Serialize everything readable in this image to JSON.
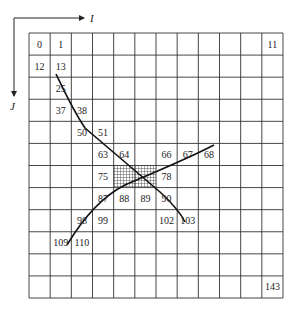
{
  "diagram": {
    "type": "grid-index-diagram",
    "axes": {
      "horizontal_label": "I",
      "vertical_label": "J"
    },
    "grid": {
      "columns": 12,
      "rows": 12,
      "x0": 29,
      "y0": 33,
      "x1": 283,
      "y1": 298
    },
    "cell_labels": [
      {
        "text": "0",
        "row": 0,
        "col": 0
      },
      {
        "text": "1",
        "row": 0,
        "col": 1
      },
      {
        "text": "11",
        "row": 0,
        "col": 11
      },
      {
        "text": "12",
        "row": 1,
        "col": 0
      },
      {
        "text": "13",
        "row": 1,
        "col": 1
      },
      {
        "text": "25",
        "row": 2,
        "col": 1
      },
      {
        "text": "37",
        "row": 3,
        "col": 1
      },
      {
        "text": "38",
        "row": 3,
        "col": 2
      },
      {
        "text": "50",
        "row": 4,
        "col": 2
      },
      {
        "text": "51",
        "row": 4,
        "col": 3
      },
      {
        "text": "63",
        "row": 5,
        "col": 3
      },
      {
        "text": "64",
        "row": 5,
        "col": 4
      },
      {
        "text": "66",
        "row": 5,
        "col": 6
      },
      {
        "text": "67",
        "row": 5,
        "col": 7
      },
      {
        "text": "68",
        "row": 5,
        "col": 8
      },
      {
        "text": "75",
        "row": 6,
        "col": 3
      },
      {
        "text": "78",
        "row": 6,
        "col": 6
      },
      {
        "text": "87",
        "row": 7,
        "col": 3
      },
      {
        "text": "88",
        "row": 7,
        "col": 4
      },
      {
        "text": "89",
        "row": 7,
        "col": 5
      },
      {
        "text": "90",
        "row": 7,
        "col": 6
      },
      {
        "text": "98",
        "row": 8,
        "col": 2
      },
      {
        "text": "99",
        "row": 8,
        "col": 3
      },
      {
        "text": "102",
        "row": 8,
        "col": 6
      },
      {
        "text": "103",
        "row": 8,
        "col": 7
      },
      {
        "text": "109",
        "row": 9,
        "col": 1
      },
      {
        "text": "110",
        "row": 9,
        "col": 2
      },
      {
        "text": "143",
        "row": 11,
        "col": 11
      }
    ],
    "hatched_cells": [
      76,
      77
    ],
    "curves": [
      {
        "name": "descending-curve",
        "from": [
          56,
          74
        ],
        "to": [
          185,
          222
        ]
      },
      {
        "name": "ascending-curve",
        "from": [
          67,
          245
        ],
        "to": [
          214,
          145
        ]
      }
    ],
    "colors": {
      "grid": "#333333",
      "curve": "#111111",
      "background": "#ffffff"
    }
  }
}
